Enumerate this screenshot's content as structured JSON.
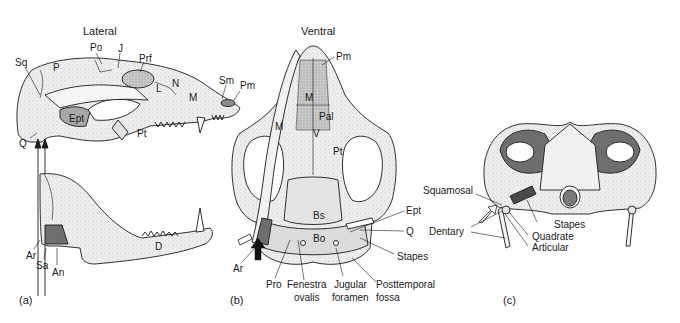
{
  "figure": {
    "panels": [
      {
        "id": "a",
        "letter": "(a)",
        "title": "Lateral",
        "labels": {
          "Sq": "Sq",
          "P": "P",
          "Po": "Po",
          "J": "J",
          "Prf": "Prf",
          "L": "L",
          "N": "N",
          "M": "M",
          "Sm": "Sm",
          "Pm": "Pm",
          "Ept": "Ept",
          "Pt": "Pt",
          "Q": "Q",
          "Ar": "Ar",
          "Sa": "Sa",
          "An": "An",
          "D": "D"
        }
      },
      {
        "id": "b",
        "letter": "(b)",
        "title": "Ventral",
        "labels": {
          "Pm": "Pm",
          "M_inner": "M",
          "M_outer": "M",
          "Pal": "Pal",
          "V": "V",
          "Pt": "Pt",
          "Bs": "Bs",
          "Bo": "Bo",
          "Ept": "Ept",
          "Q": "Q",
          "Stapes": "Stapes",
          "Ar": "Ar",
          "Pro": "Pro",
          "Fenestra_1": "Fenestra",
          "Fenestra_2": "ovalis",
          "Jugular_1": "Jugular",
          "Jugular_2": "foramen",
          "Posttemporal_1": "Posttemporal",
          "Posttemporal_2": "fossa"
        }
      },
      {
        "id": "c",
        "letter": "(c)",
        "title": "",
        "labels": {
          "Squamosal": "Squamosal",
          "Dentary": "Dentary",
          "Stapes": "Stapes",
          "Quadrate": "Quadrate",
          "Articular": "Articular"
        }
      }
    ],
    "colors": {
      "ink": "#1a1a1a",
      "bone": "#ececec",
      "bone_dark": "#9a9a9a",
      "shadow": "#6e6e6e",
      "background": "#ffffff"
    }
  }
}
